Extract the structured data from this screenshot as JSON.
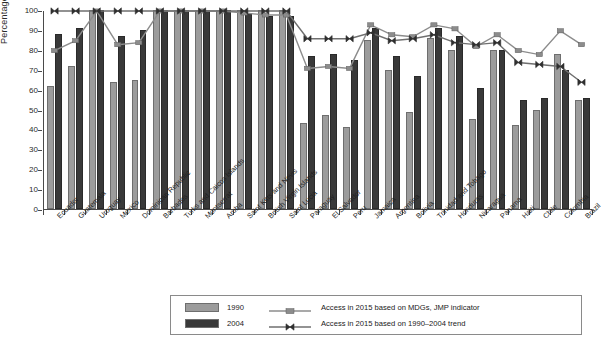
{
  "chart_data": {
    "type": "bar",
    "title": "",
    "xlabel": "",
    "ylabel": "Percentage",
    "ylim": [
      0,
      100
    ],
    "yticks": [
      0,
      10,
      20,
      30,
      40,
      50,
      60,
      70,
      80,
      90,
      100
    ],
    "grid": false,
    "legend_position": "bottom-center",
    "categories": [
      "Ecuador",
      "Guatemala",
      "Uruguay",
      "Mexico",
      "Dominican Republic",
      "Barbados",
      "Turks and Caicos Islands",
      "Montserrat",
      "Aruba",
      "Saint Kitts and Nevis",
      "British Virgin Islands",
      "Saint Lucia",
      "Paraguay",
      "El Salvador",
      "Peru",
      "Jamaica",
      "Argentina",
      "Bolivia",
      "Trinidad and Tobago",
      "Honduras",
      "Nicaragua",
      "Panama",
      "Haiti",
      "Chile",
      "Colombia",
      "Brazil"
    ],
    "series": [
      {
        "name": "1990",
        "kind": "bar",
        "color": "#9c9c9c",
        "values": [
          62,
          72,
          100,
          64,
          65,
          100,
          100,
          100,
          100,
          100,
          100,
          100,
          43,
          47,
          41,
          85,
          70,
          49,
          86,
          80,
          45,
          80,
          42,
          50,
          78,
          55
        ]
      },
      {
        "name": "2004",
        "kind": "bar",
        "color": "#393939",
        "values": [
          88,
          91,
          100,
          87,
          90,
          100,
          100,
          100,
          100,
          98,
          97,
          97,
          77,
          78,
          75,
          91,
          77,
          67,
          91,
          87,
          61,
          80,
          55,
          56,
          70,
          56
        ]
      },
      {
        "name": "Access in 2015 based on MDGs, JMP indicator",
        "kind": "line",
        "marker": "square",
        "color": "#8c8c8c",
        "values": [
          80,
          85,
          100,
          83,
          84,
          100,
          100,
          100,
          100,
          99,
          98,
          98,
          71,
          72,
          71,
          93,
          88,
          87,
          93,
          91,
          82,
          88,
          80,
          78,
          90,
          83
        ]
      },
      {
        "name": "Access in 2015 based on 1990–2004 trend",
        "kind": "line",
        "marker": "bowtie",
        "color": "#6f6f6f",
        "values": [
          100,
          100,
          100,
          100,
          100,
          100,
          100,
          100,
          100,
          100,
          100,
          100,
          86,
          86,
          86,
          89,
          85,
          86,
          88,
          84,
          83,
          84,
          74,
          73,
          72,
          64
        ]
      }
    ]
  },
  "legend": {
    "items": [
      {
        "label": "1990",
        "type": "swatch",
        "color": "#9c9c9c"
      },
      {
        "label": "2004",
        "type": "swatch",
        "color": "#393939"
      },
      {
        "label": "Access in 2015 based on MDGs, JMP indicator",
        "type": "line-square",
        "color": "#8c8c8c"
      },
      {
        "label": "Access in 2015 based on 1990–2004 trend",
        "type": "line-bowtie",
        "color": "#6f6f6f"
      }
    ]
  }
}
